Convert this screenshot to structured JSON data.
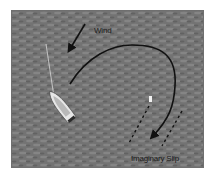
{
  "diagram": {
    "labels": {
      "wind": "Wind",
      "slip": "Imaginary Slip"
    },
    "colors": {
      "water": "#737373",
      "water_light": "#8a8a8a",
      "water_dark": "#5e5e5e",
      "path": "#111111",
      "boat_hull": "#e6e6e6",
      "mast_line": "#d8d8d8",
      "marker": "#f2f2f2",
      "border": "#6f6f6f"
    },
    "elements": [
      {
        "name": "wind-arrow",
        "description": "Arrow pointing down-left indicating wind direction"
      },
      {
        "name": "sailboat",
        "description": "Sailboat viewed from above with mast line"
      },
      {
        "name": "approach-path",
        "description": "Curved black path from boat around to the slip"
      },
      {
        "name": "imaginary-slip",
        "description": "Two dashed parallel lines outlining a slip"
      },
      {
        "name": "slip-marker",
        "description": "Small white marker at the head of the slip"
      }
    ]
  }
}
